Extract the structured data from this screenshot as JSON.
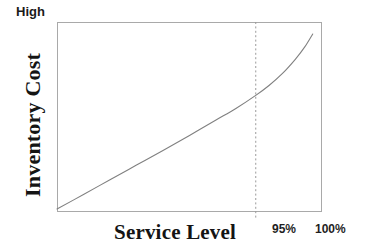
{
  "figure": {
    "background_color": "#ffffff",
    "frame_color": "#a9a9a9",
    "curve_color": "#808080",
    "marker_line_color": "#9a9a9a",
    "text_color": "#141414"
  },
  "labels": {
    "high": "High",
    "y_axis_title": "Inventory Cost",
    "x_axis_title": "Service Level",
    "tick_95": "95%",
    "tick_100": "100%"
  },
  "chart_data": {
    "type": "line",
    "title": "",
    "subtitle": "",
    "xlabel": "Service Level",
    "ylabel": "Inventory Cost",
    "grid": false,
    "legend": false,
    "legend_position": "none",
    "x_tick_labels": [
      "95%",
      "100%"
    ],
    "x_tick_values": [
      95,
      100
    ],
    "y_tick_labels": [
      "High"
    ],
    "y_axis_annotation_top": "High",
    "xlim": [
      80,
      100
    ],
    "ylim": [
      0,
      100
    ],
    "annotations": [
      {
        "name": "service-level-95-marker",
        "type": "vertical-dashed-line",
        "x": 95,
        "label": "95%"
      }
    ],
    "series": [
      {
        "name": "Inventory Cost",
        "style": "solid",
        "color": "#808080",
        "x": [
          80.0,
          82.0,
          84.0,
          86.0,
          88.0,
          90.0,
          92.0,
          93.5,
          95.0,
          96.0,
          97.0,
          98.0,
          98.7,
          99.3
        ],
        "values": [
          1.6,
          9.2,
          17.0,
          24.7,
          32.4,
          40.3,
          48.4,
          54.5,
          61.4,
          66.6,
          72.8,
          80.5,
          86.9,
          93.7
        ]
      }
    ]
  }
}
